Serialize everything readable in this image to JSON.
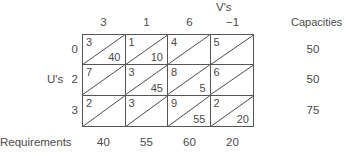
{
  "header": {
    "v_label": "V's",
    "v_values": [
      "3",
      "1",
      "6",
      "−1"
    ],
    "capacities_label": "Capacities"
  },
  "rows": {
    "u_label": "U's",
    "u_values": [
      "0",
      "2",
      "3"
    ],
    "capacities": [
      "50",
      "50",
      "75"
    ]
  },
  "cells": [
    [
      {
        "cost": "3",
        "alloc": "40"
      },
      {
        "cost": "1",
        "alloc": "10"
      },
      {
        "cost": "4",
        "alloc": ""
      },
      {
        "cost": "5",
        "alloc": ""
      }
    ],
    [
      {
        "cost": "7",
        "alloc": ""
      },
      {
        "cost": "3",
        "alloc": "45"
      },
      {
        "cost": "8",
        "alloc": "5"
      },
      {
        "cost": "6",
        "alloc": ""
      }
    ],
    [
      {
        "cost": "2",
        "alloc": ""
      },
      {
        "cost": "3",
        "alloc": ""
      },
      {
        "cost": "9",
        "alloc": "55"
      },
      {
        "cost": "2",
        "alloc": "20"
      }
    ]
  ],
  "footer": {
    "requirements_label": "Requirements",
    "requirements": [
      "40",
      "55",
      "60",
      "20"
    ]
  }
}
